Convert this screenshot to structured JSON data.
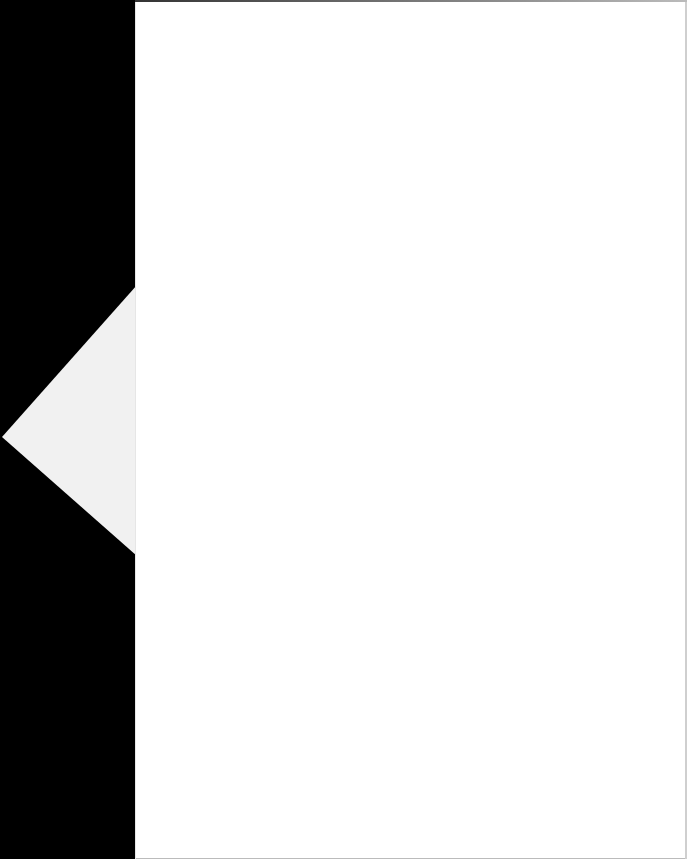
{
  "document": {
    "type": "scanned-blank-page",
    "text": "",
    "colors": {
      "background": "#000000",
      "page": "#ffffff",
      "flap": "#f2f2f2"
    }
  }
}
